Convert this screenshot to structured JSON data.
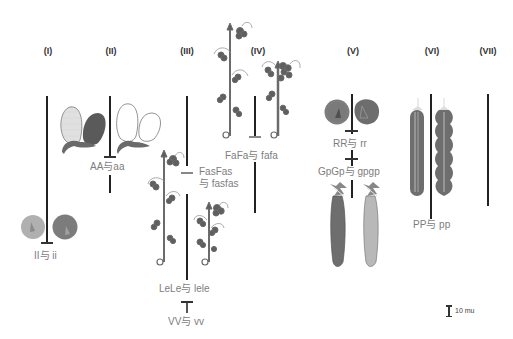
{
  "chromosomes": [
    {
      "id": "I",
      "label": "(I)"
    },
    {
      "id": "II",
      "label": "(II)"
    },
    {
      "id": "III",
      "label": "(III)"
    },
    {
      "id": "IV",
      "label": "(IV)"
    },
    {
      "id": "V",
      "label": "(V)"
    },
    {
      "id": "VI",
      "label": "(VI)"
    },
    {
      "id": "VII",
      "label": "(VII)"
    }
  ],
  "genes": {
    "I": {
      "label": "II与 ii",
      "trait": "seed color (yellow vs green)"
    },
    "A": {
      "label": "AA与aa",
      "trait": "flower color (colored vs white)"
    },
    "Fas": {
      "label_line1": "FasFas",
      "label_line2": "与 fasfas",
      "trait": "fasciated stem"
    },
    "Le": {
      "label": "LeLe与 lele",
      "trait": "stem length (tall vs dwarf)"
    },
    "V": {
      "label": "VV与 vv",
      "trait": "pod form"
    },
    "Fa": {
      "label": "FaFa与 fafa",
      "trait": "flower position (axial vs terminal)"
    },
    "R": {
      "label": "RR与 rr",
      "trait": "seed shape (round vs wrinkled)"
    },
    "Gp": {
      "label": "GpGp与 gpgp",
      "trait": "pod color (green vs yellow)"
    },
    "P": {
      "label": "PP与 pp",
      "trait": "pod shape (inflated vs constricted)"
    }
  },
  "scale_bar": {
    "label": "10 mu"
  },
  "colors": {
    "chromosome": "#222222",
    "label_text": "#7d7d7d",
    "roman_text": "#333333",
    "plant_green": "#6b6b6b",
    "seed_yellow": "#a8a8a8",
    "seed_green": "#7a7a7a",
    "pod_green": "#6e6e6e",
    "pod_yellow": "#b5b5b5",
    "flower_purple": "#5a5a5a"
  }
}
